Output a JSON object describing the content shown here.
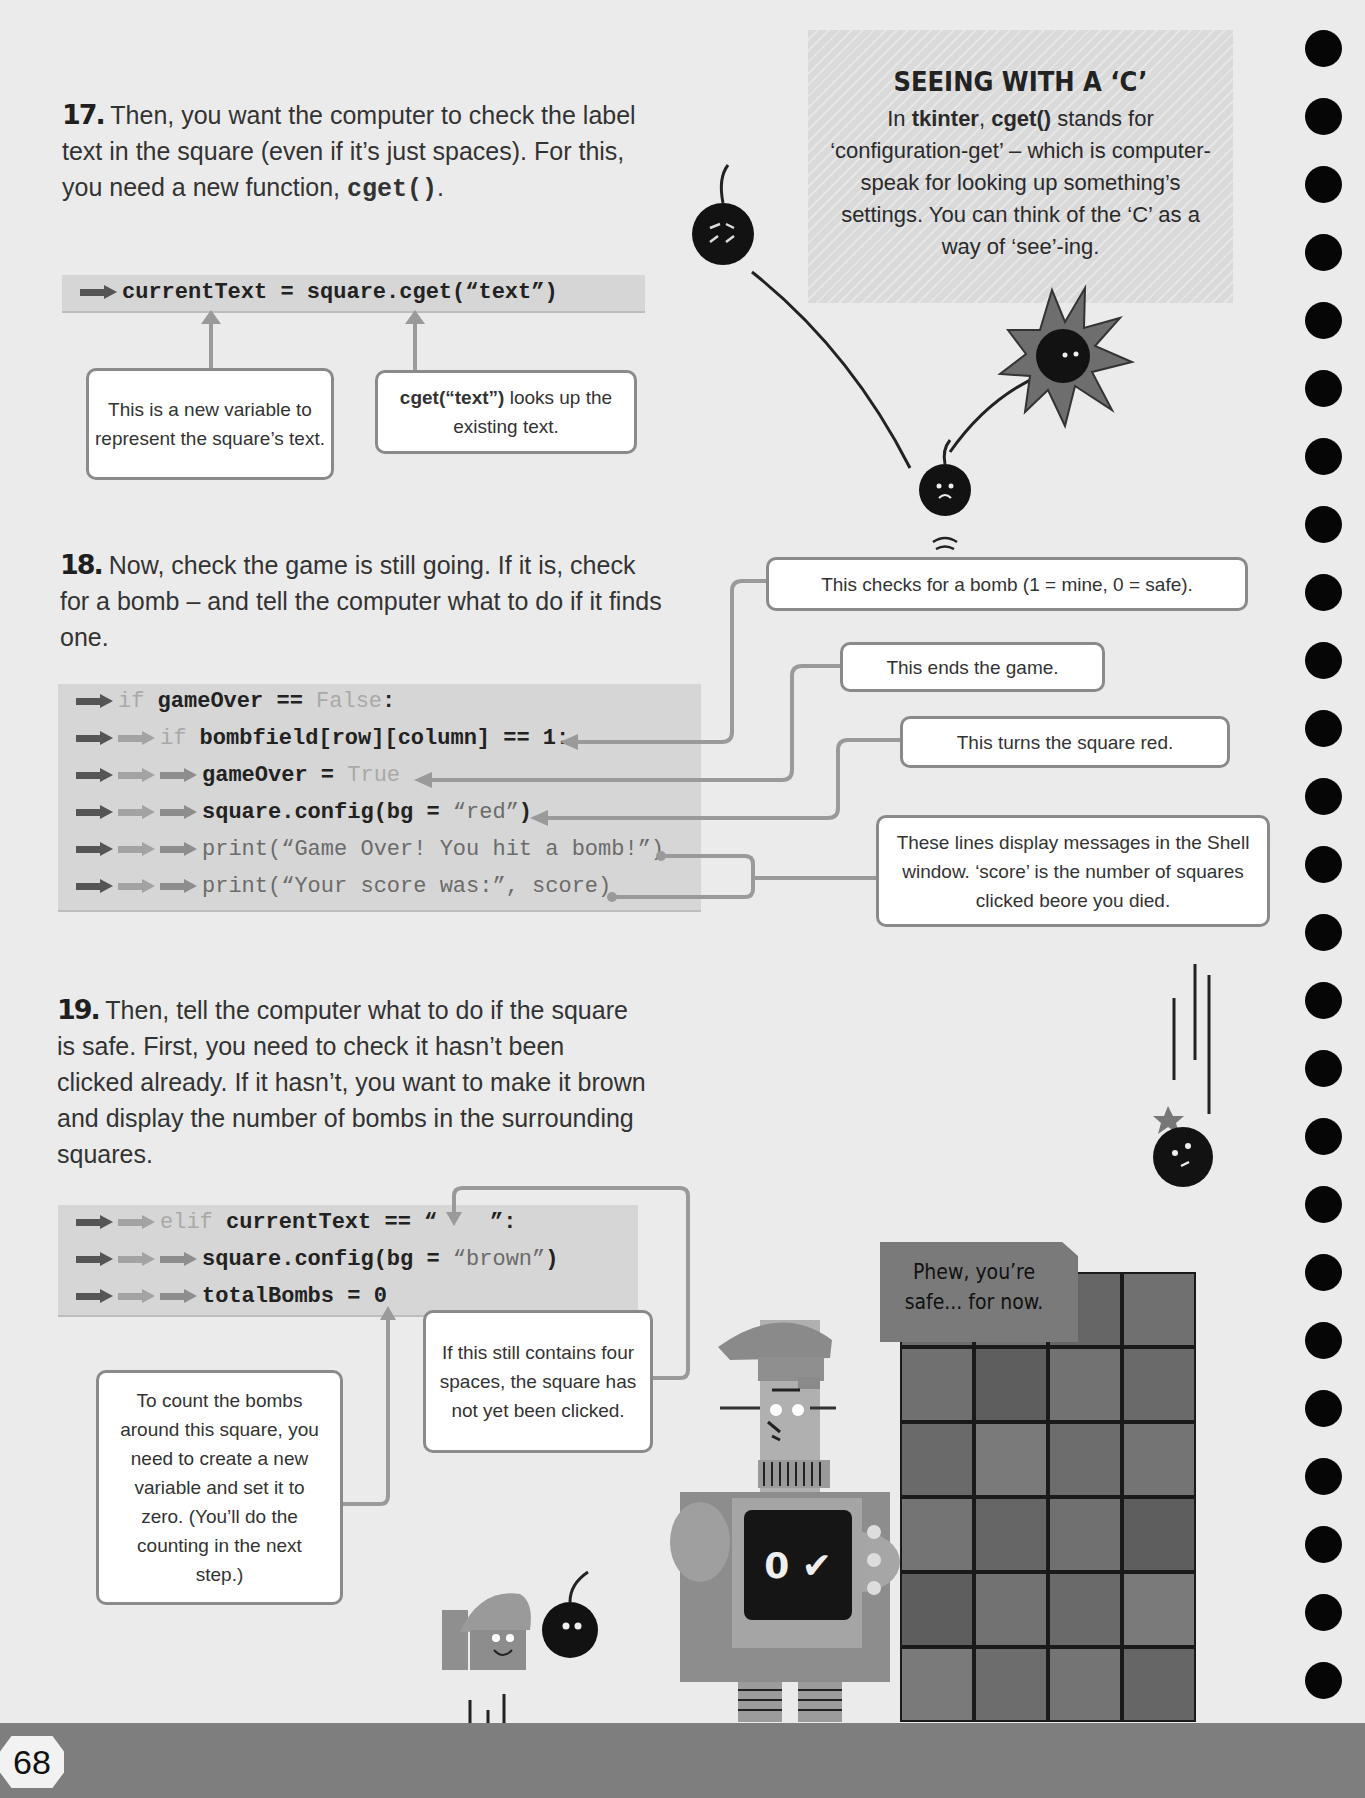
{
  "page": {
    "number": "68"
  },
  "sidebar_box": {
    "title": "SEEING WITH A ‘C’",
    "body_prefix": "In ",
    "tkinter": "tkinter",
    "comma": ", ",
    "cget": "cget()",
    "body_rest": " stands for ‘configuration-get’ – which is computer-speak for looking up something’s settings. You can think of the ‘C’ as a way of ‘see’-ing."
  },
  "step17": {
    "number": "17.",
    "text_before": " Then, you want the computer to check the label text in the square (even if it’s just spaces). For this, you need a new function, ",
    "code_word": "cget()",
    "text_after": ".",
    "code": "currentText = square.cget(“text”)",
    "callouts": [
      "This is a new variable to represent the square’s text.",
      {
        "bold": "cget(“text”)",
        "rest": " looks up the existing text."
      }
    ]
  },
  "step18": {
    "number": "18.",
    "text": " Now, check the game is still going. If it is, check for a bomb – and tell the computer what to do if it finds one.",
    "code_lines": [
      {
        "indent": 1,
        "kw": "if",
        "code": " gameOver == ",
        "tail_kw": "False",
        "tail": ":"
      },
      {
        "indent": 2,
        "kw": "if",
        "code": " bombfield[row][column] == 1:"
      },
      {
        "indent": 3,
        "code": "gameOver = ",
        "tail_kw": "True"
      },
      {
        "indent": 3,
        "code": "square.config(bg = ",
        "str": "“red”",
        "tail": ")"
      },
      {
        "indent": 3,
        "code": "print(“Game Over! You hit a bomb!”)"
      },
      {
        "indent": 3,
        "code": "print(“Your score was:”, score)"
      }
    ],
    "callouts": [
      "This checks for a bomb (1 = mine, 0 = safe).",
      "This ends the game.",
      "This turns the square red.",
      "These lines display messages in the Shell window. ‘score’ is the number of squares clicked beore you died."
    ]
  },
  "step19": {
    "number": "19.",
    "text": " Then, tell the computer what to do if the square is safe. First, you need to check it hasn’t been clicked already. If it hasn’t, you want to make it brown and display the number of bombs in the surrounding squares.",
    "code_lines": [
      {
        "indent": 2,
        "kw": "elif",
        "code": " currentText == “    ”:"
      },
      {
        "indent": 3,
        "code": "square.config(bg = ",
        "str": "“brown”",
        "tail": ")"
      },
      {
        "indent": 3,
        "code": "totalBombs = 0"
      }
    ],
    "callouts": [
      "If this still contains four spaces, the square has not yet been clicked.",
      "To count the bombs around this square, you need to create a new variable and set it to zero. (You’ll do the counting in the next step.)"
    ]
  },
  "illustration": {
    "speech_bubble": "Phew, you’re safe... for now.",
    "screen_display": "0 ✔"
  },
  "colors": {
    "page_bg": "#ebebeb",
    "code_bg": "#d6d6d6",
    "sidebar_bg": "#dcdcdc",
    "footer_bg": "#7e7e7e",
    "callout_border": "#8a8a8a"
  }
}
